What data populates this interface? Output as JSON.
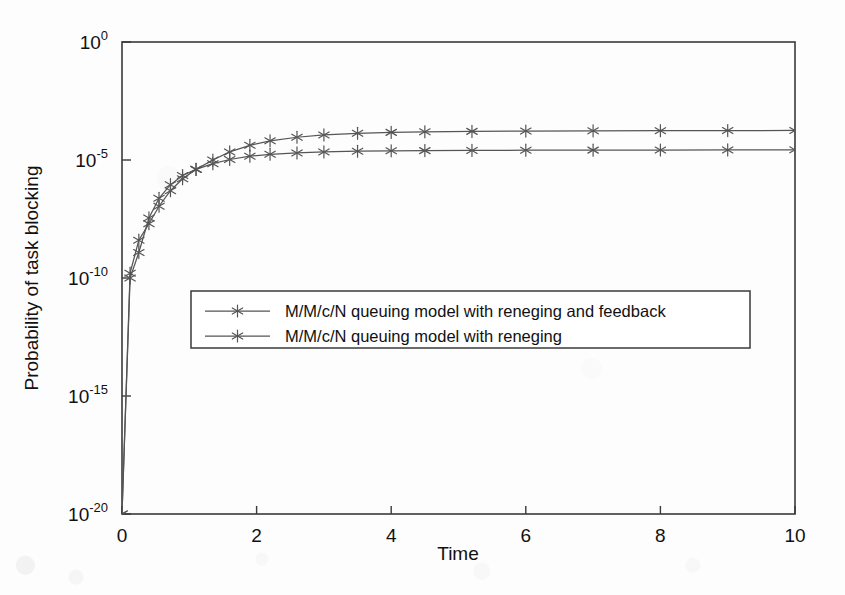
{
  "chart_data": {
    "type": "line",
    "title": "",
    "xlabel": "Time",
    "ylabel": "Probability of task blocking",
    "yscale": "log",
    "xlim": [
      0,
      10
    ],
    "ylim": [
      1e-20,
      1
    ],
    "grid": false,
    "legend_position": "center-left",
    "marker": "asterisk",
    "line_color": "#555555",
    "axis_color": "#333333",
    "xticks": [
      0,
      2,
      4,
      6,
      8,
      10
    ],
    "xtick_labels": [
      "0",
      "2",
      "4",
      "6",
      "8",
      "10"
    ],
    "yticks": [
      1,
      1e-05,
      1e-10,
      1e-15,
      1e-20
    ],
    "ytick_labels": [
      {
        "base": "10",
        "exp": "0"
      },
      {
        "base": "10",
        "exp": "-5"
      },
      {
        "base": "10",
        "exp": "-10"
      },
      {
        "base": "10",
        "exp": "-15"
      },
      {
        "base": "10",
        "exp": "-20"
      }
    ],
    "series": [
      {
        "name": "M/M/c/N queuing model with reneging and feedback",
        "x": [
          0.0,
          0.12,
          0.25,
          0.4,
          0.55,
          0.72,
          0.9,
          1.1,
          1.35,
          1.6,
          1.9,
          2.2,
          2.6,
          3.0,
          3.5,
          4.0,
          4.5,
          5.2,
          6.0,
          7.0,
          8.0,
          9.0,
          10.0
        ],
        "y": [
          1e-20,
          1.6e-10,
          4e-09,
          2e-08,
          1.1e-07,
          5e-07,
          1.6e-06,
          4e-06,
          1e-05,
          2.2e-05,
          4.2e-05,
          6.5e-05,
          9.2e-05,
          0.000115,
          0.000135,
          0.000148,
          0.000156,
          0.000163,
          0.000168,
          0.000172,
          0.000175,
          0.000177,
          0.000178
        ],
        "y_plateau_label": "~2e-4"
      },
      {
        "name": "M/M/c/N queuing model with reneging",
        "x": [
          0.0,
          0.12,
          0.25,
          0.4,
          0.55,
          0.72,
          0.9,
          1.1,
          1.35,
          1.6,
          1.9,
          2.2,
          2.6,
          3.0,
          3.5,
          4.0,
          4.5,
          5.2,
          6.0,
          7.0,
          8.0,
          9.0,
          10.0
        ],
        "y": [
          1e-20,
          1e-10,
          1.2e-09,
          3.5e-08,
          2.4e-07,
          9e-07,
          2.2e-06,
          4e-06,
          7e-06,
          1.05e-05,
          1.45e-05,
          1.75e-05,
          2e-05,
          2.2e-05,
          2.35e-05,
          2.45e-05,
          2.5e-05,
          2.55e-05,
          2.6e-05,
          2.62e-05,
          2.65e-05,
          2.68e-05,
          2.7e-05
        ],
        "y_plateau_label": "~3e-5"
      }
    ]
  },
  "legend": {
    "entries": [
      {
        "label": "M/M/c/N queuing model with reneging and feedback"
      },
      {
        "label": "M/M/c/N queuing model with reneging"
      }
    ]
  },
  "axes": {
    "x_title": "Time",
    "y_title": "Probability of task blocking"
  }
}
